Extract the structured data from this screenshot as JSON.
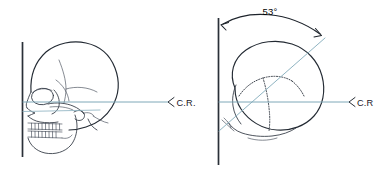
{
  "figure": {
    "background_color": "#ffffff",
    "width": 376,
    "height": 172
  },
  "colors": {
    "ink": "#232a33",
    "ray_blue": "#7fa8b8",
    "plane_dark": "#2a3038",
    "suture": "#2b323c"
  },
  "panels": {
    "left": {
      "name": "lateral-skull-view",
      "description": "Lateral projection of skull against vertical reference plane",
      "cr_label": "C.R.",
      "cr_ray_angle_degrees": 0,
      "reference_plane": "vertical"
    },
    "right": {
      "name": "superior-skull-view",
      "description": "Superior axial projection of skull rotated from vertical reference plane",
      "cr_label": "C.R",
      "angle_label": "53°",
      "angle_value": 53,
      "angle_unit": "degrees",
      "reference_plane": "vertical",
      "oblique_ray_angle_degrees": 53
    }
  },
  "annotations": {
    "central_ray_abbreviation": "C.R.",
    "rotation_angle": "53°"
  }
}
